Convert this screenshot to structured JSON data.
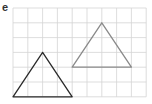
{
  "label": "e",
  "grid": {
    "origin_x": 13,
    "origin_y": 8,
    "cell": 14.8,
    "cols": 9,
    "rows": 6,
    "color": "#d4d4d4"
  },
  "shapes": [
    {
      "name": "original-triangle",
      "stroke": "#2a2a2a",
      "points_grid": [
        [
          0,
          6
        ],
        [
          2,
          3
        ],
        [
          4,
          6
        ]
      ]
    },
    {
      "name": "translated-triangle",
      "stroke": "#8a8a8a",
      "points_grid": [
        [
          4,
          4
        ],
        [
          6,
          1
        ],
        [
          8,
          4
        ]
      ]
    }
  ]
}
